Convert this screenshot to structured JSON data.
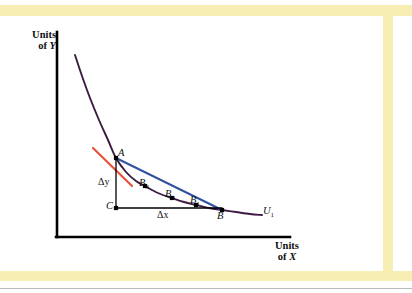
{
  "figure": {
    "kind": "indifference-curve-mrs-diagram",
    "background": "#ffffff",
    "band_color": "#f7eeb4",
    "rule_color": "#b9b9b9"
  },
  "axes": {
    "y_title_line1": "Units",
    "y_title_line2_prefix": "of ",
    "y_title_line2_var": "Y",
    "x_title_line1": "Units",
    "x_title_line2_prefix": "of ",
    "x_title_line2_var": "X",
    "axis_color": "#000000",
    "origin": {
      "x": 57,
      "y": 237
    },
    "y_top": 32,
    "x_right": 290
  },
  "labels": {
    "A": "A",
    "B": "B",
    "B1_base": "B",
    "B1_sub": "1",
    "B2_base": "B",
    "B2_sub": "2",
    "B3_base": "B",
    "B3_sub": "3",
    "C": "C",
    "delta_y": "Δy",
    "delta_x": "Δx",
    "U1_base": "U",
    "U1_sub": "1"
  },
  "chart_data": {
    "type": "line",
    "title": "",
    "xlabel": "Units of X",
    "ylabel": "Units of Y",
    "grid": false,
    "legend": "none",
    "curves": [
      {
        "name": "U1",
        "role": "indifference-curve",
        "color": "#3d1a43",
        "width": 1.9,
        "label": "U1",
        "points": [
          [
            75,
            55
          ],
          [
            82,
            76
          ],
          [
            90,
            98
          ],
          [
            99,
            120
          ],
          [
            108,
            140
          ],
          [
            116,
            158
          ],
          [
            126,
            172
          ],
          [
            136,
            181
          ],
          [
            145,
            186
          ],
          [
            158,
            193
          ],
          [
            172,
            198
          ],
          [
            184,
            202
          ],
          [
            196,
            205
          ],
          [
            209,
            208
          ],
          [
            222,
            210
          ],
          [
            236,
            212
          ],
          [
            250,
            214
          ],
          [
            262,
            215
          ]
        ]
      },
      {
        "name": "tangent-at-A",
        "role": "tangent-line",
        "color": "#e8523a",
        "width": 2.2,
        "points": [
          [
            93,
            148
          ],
          [
            132,
            186
          ]
        ]
      },
      {
        "name": "chord-A-to-B",
        "role": "secant-chord",
        "color": "#2d52a0",
        "width": 2.0,
        "points": [
          [
            116,
            158
          ],
          [
            222,
            210
          ]
        ]
      },
      {
        "name": "delta-y-segment",
        "role": "vertical-leg",
        "color": "#000000",
        "width": 1.3,
        "points": [
          [
            116,
            158
          ],
          [
            116,
            208
          ]
        ]
      },
      {
        "name": "delta-x-segment",
        "role": "horizontal-leg",
        "color": "#000000",
        "width": 1.3,
        "points": [
          [
            116,
            208
          ],
          [
            222,
            208
          ]
        ]
      }
    ],
    "points": [
      {
        "name": "A",
        "x": 116,
        "y": 158,
        "marker": "square",
        "color": "#000000"
      },
      {
        "name": "B3",
        "x": 145,
        "y": 186,
        "marker": "square",
        "color": "#000000"
      },
      {
        "name": "B2",
        "x": 172,
        "y": 198,
        "marker": "square",
        "color": "#000000"
      },
      {
        "name": "B1",
        "x": 196,
        "y": 205,
        "marker": "square",
        "color": "#000000"
      },
      {
        "name": "B",
        "x": 222,
        "y": 210,
        "marker": "square",
        "color": "#000000"
      },
      {
        "name": "C",
        "x": 116,
        "y": 208,
        "marker": "square",
        "color": "#000000"
      }
    ]
  }
}
